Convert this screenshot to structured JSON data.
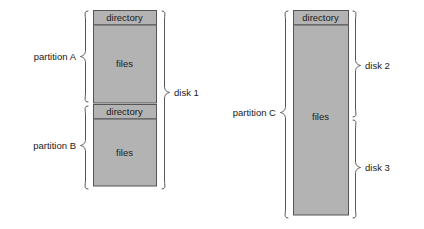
{
  "diagram": {
    "colors": {
      "fill": "#b3b3b3",
      "stroke": "#555555",
      "text": "#1a1a1a",
      "background": "#ffffff"
    },
    "disks": [
      {
        "id": "disk-1",
        "label": "disk 1",
        "partitions": [
          {
            "id": "partition-a",
            "label": "partition A",
            "bands": [
              {
                "id": "directory",
                "label": "directory"
              },
              {
                "id": "files",
                "label": "files"
              }
            ]
          },
          {
            "id": "partition-b",
            "label": "partition B",
            "bands": [
              {
                "id": "directory",
                "label": "directory"
              },
              {
                "id": "files",
                "label": "files"
              }
            ]
          }
        ]
      },
      {
        "id": "disk-2-3",
        "labels": [
          "disk 2",
          "disk 3"
        ],
        "partitions": [
          {
            "id": "partition-c",
            "label": "partition C",
            "bands": [
              {
                "id": "directory",
                "label": "directory"
              },
              {
                "id": "files",
                "label": "files"
              }
            ]
          }
        ]
      }
    ],
    "labels": {
      "partition_a": "partition A",
      "partition_b": "partition B",
      "partition_c": "partition C",
      "disk_1": "disk 1",
      "disk_2": "disk 2",
      "disk_3": "disk 3",
      "directory_a": "directory",
      "files_a": "files",
      "directory_b": "directory",
      "files_b": "files",
      "directory_c": "directory",
      "files_c": "files"
    }
  }
}
